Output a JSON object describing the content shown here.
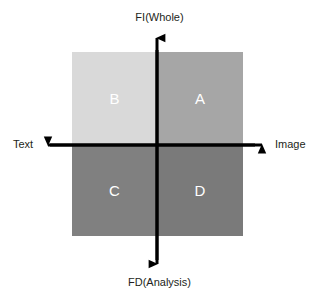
{
  "diagram": {
    "type": "quadrant-matrix",
    "axes": {
      "vertical": {
        "top_label": "FI(Whole)",
        "bottom_label": "FD(Analysis)",
        "color": "#000000"
      },
      "horizontal": {
        "left_label": "Text",
        "right_label": "Image",
        "color": "#000000"
      }
    },
    "quadrants": [
      {
        "id": "A",
        "label": "A",
        "position": "top-right",
        "fill": "#a6a6a6",
        "text_color": "#ffffff"
      },
      {
        "id": "B",
        "label": "B",
        "position": "top-left",
        "fill": "#d9d9d9",
        "text_color": "#ffffff"
      },
      {
        "id": "C",
        "label": "C",
        "position": "bottom-left",
        "fill": "#808080",
        "text_color": "#ffffff"
      },
      {
        "id": "D",
        "label": "D",
        "position": "bottom-right",
        "fill": "#7a7a7a",
        "text_color": "#ffffff"
      }
    ]
  }
}
